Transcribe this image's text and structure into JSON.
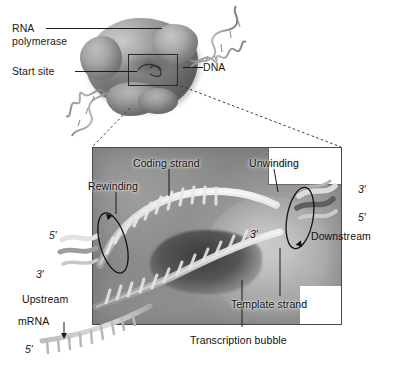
{
  "figure": {
    "type": "biology-diagram",
    "background_color": "#ffffff",
    "panel_color": "#8a8a8a",
    "text_color": "#1a1a1a"
  },
  "inset": {
    "labels": {
      "rna_polymerase_line1": "RNA",
      "rna_polymerase_line2": "polymerase",
      "start_site": "Start site",
      "dna": "DNA"
    }
  },
  "panel": {
    "labels": {
      "coding_strand": "Coding strand",
      "template_strand": "Template strand",
      "rewinding": "Rewinding",
      "unwinding": "Unwinding",
      "upstream": "Upstream",
      "downstream": "Downstream",
      "mrna": "mRNA",
      "transcription_bubble": "Transcription bubble"
    },
    "prime_labels": {
      "coding_left_5": "5′",
      "coding_left_3": "3′",
      "mrna_5": "5′",
      "template_mid_3": "3′",
      "downstream_3": "3′",
      "downstream_5": "5′"
    }
  }
}
